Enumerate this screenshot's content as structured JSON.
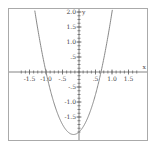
{
  "chart_data": {
    "type": "line",
    "title": "",
    "xlabel": "x",
    "ylabel": "y",
    "xlim": [
      -1.75,
      1.75
    ],
    "ylim": [
      -2.1,
      2.0
    ],
    "grid": false,
    "legend": null,
    "x_ticks": [
      "-1.5",
      "-1.0",
      "-.5",
      ".5",
      "1.0",
      "1.5"
    ],
    "y_ticks": [
      "2.0",
      "1.5",
      "1.0",
      ".5",
      "-.5",
      "-1.0",
      "-1.5"
    ],
    "series": [
      {
        "name": "y = 3x^2 + x - 2",
        "color": "#888888",
        "x": [
          -1.25,
          -1.0,
          -0.75,
          -0.5,
          -0.25,
          -0.1667,
          0,
          0.25,
          0.5,
          0.6667,
          0.75,
          1.0
        ],
        "y": [
          1.44,
          0.0,
          -1.06,
          -1.75,
          -2.06,
          -2.08,
          -2.0,
          -1.56,
          -0.75,
          0.0,
          0.44,
          2.0
        ]
      }
    ]
  }
}
